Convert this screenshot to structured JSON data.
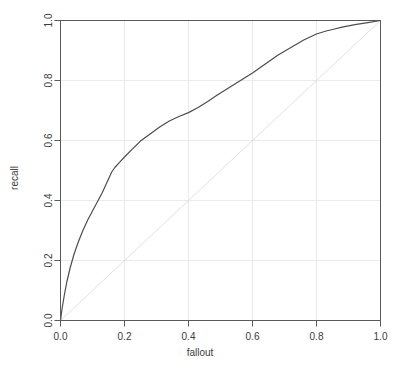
{
  "chart_data": {
    "type": "line",
    "title": "",
    "xlabel": "fallout",
    "ylabel": "recall",
    "xlim": [
      0.0,
      1.0
    ],
    "ylim": [
      0.0,
      1.0
    ],
    "grid": true,
    "legend": "none",
    "xticks": [
      "0.0",
      "0.2",
      "0.4",
      "0.6",
      "0.8",
      "1.0"
    ],
    "xtick_values": [
      0.0,
      0.2,
      0.4,
      0.6,
      0.8,
      1.0
    ],
    "yticks": [
      "0.0",
      "0.2",
      "0.4",
      "0.6",
      "0.8",
      "1.0"
    ],
    "ytick_values": [
      0.0,
      0.2,
      0.4,
      0.6,
      0.8,
      1.0
    ],
    "series": [
      {
        "name": "roc-curve",
        "color": "#4d4d4d",
        "x": [
          0.0,
          0.005,
          0.012,
          0.02,
          0.03,
          0.042,
          0.055,
          0.07,
          0.085,
          0.1,
          0.115,
          0.13,
          0.145,
          0.16,
          0.17,
          0.185,
          0.2,
          0.225,
          0.25,
          0.28,
          0.31,
          0.34,
          0.37,
          0.4,
          0.43,
          0.46,
          0.49,
          0.52,
          0.55,
          0.58,
          0.6,
          0.64,
          0.68,
          0.72,
          0.76,
          0.8,
          0.83,
          0.85,
          0.88,
          0.92,
          0.96,
          1.0
        ],
        "y": [
          0.0,
          0.04,
          0.085,
          0.13,
          0.175,
          0.22,
          0.26,
          0.3,
          0.335,
          0.365,
          0.395,
          0.425,
          0.46,
          0.495,
          0.51,
          0.528,
          0.545,
          0.572,
          0.598,
          0.622,
          0.645,
          0.665,
          0.68,
          0.693,
          0.71,
          0.73,
          0.752,
          0.772,
          0.792,
          0.812,
          0.825,
          0.855,
          0.885,
          0.91,
          0.935,
          0.955,
          0.965,
          0.97,
          0.978,
          0.986,
          0.993,
          1.0
        ]
      },
      {
        "name": "chance-diagonal",
        "color": "#e2e2e2",
        "x": [
          0.0,
          1.0
        ],
        "y": [
          0.0,
          1.0
        ]
      }
    ]
  },
  "axes": {
    "x_title": "fallout",
    "y_title": "recall"
  },
  "style": {
    "background": "#ffffff",
    "grid_color": "#ebebeb",
    "box_color": "#5a5a5a",
    "curve_color": "#4d4d4d",
    "diagonal_color": "#e2e2e2",
    "text_color": "#3b3b3b"
  }
}
